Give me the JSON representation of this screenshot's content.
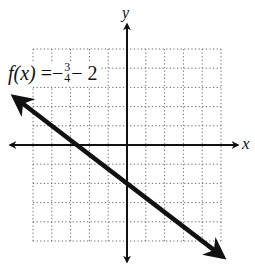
{
  "chart_data": {
    "type": "line",
    "title": "",
    "function_label": {
      "name": "f(x)",
      "equals": "=",
      "sign": "−",
      "numerator": "3",
      "denominator": "4",
      "constant": "− 2"
    },
    "xlabel": "x",
    "ylabel": "y",
    "xlim": [
      -5,
      5
    ],
    "ylim": [
      -5,
      5
    ],
    "grid": true,
    "grid_style": "dotted",
    "axes_arrows": true,
    "series": [
      {
        "name": "f(x) = -3/4 x - 2",
        "slope": -0.75,
        "intercept": -2,
        "x": [
          -6,
          5.1
        ],
        "y": [
          2.5,
          -5.825
        ],
        "arrows_both_ends": true
      }
    ],
    "legend": "inline label upper-left"
  },
  "colors": {
    "line": "#111111",
    "grid": "#555555",
    "axis": "#111111",
    "background": "#ffffff"
  }
}
